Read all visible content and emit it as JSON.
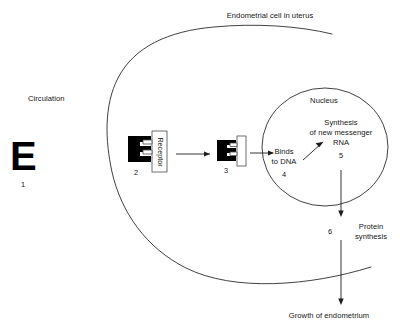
{
  "figure": {
    "type": "biological-process-diagram",
    "title_text": "Endometrial cell in uterus"
  },
  "labels": {
    "cell_title": "Endometrial cell in uterus",
    "circulation": "Circulation",
    "nucleus": "Nucleus",
    "receptor": "Receptor",
    "binds_to_dna_line1": "Binds",
    "binds_to_dna_line2": "to DNA",
    "synthesis_line1": "Synthesis",
    "synthesis_line2": "of new messenger",
    "synthesis_line3": "RNA",
    "protein_line1": "Protein",
    "protein_line2": "synthesis",
    "growth": "Growth of endometrium",
    "estrogen_glyph": "E"
  },
  "steps": [
    {
      "number": "1",
      "name": "free-estrogen-in-circulation"
    },
    {
      "number": "2",
      "name": "estrogen-receptor-binding"
    },
    {
      "number": "3",
      "name": "estrogen-receptor-complex"
    },
    {
      "number": "4",
      "name": "binds-to-dna"
    },
    {
      "number": "5",
      "name": "messenger-rna-synthesis"
    },
    {
      "number": "6",
      "name": "protein-synthesis"
    }
  ],
  "colors": {
    "ink": "#161616",
    "stroke": "#2b2b2b",
    "estrogen_fill": "#000000",
    "receptor_fill": "#ffffff"
  }
}
